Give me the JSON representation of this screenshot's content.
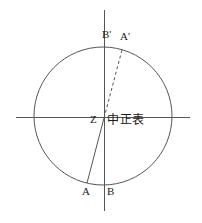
{
  "figure": {
    "type": "geometric-diagram",
    "width": 202,
    "height": 223,
    "background_color": "#ffffff",
    "stroke_color": "#555555",
    "text_color": "#1a1a1a",
    "circle": {
      "center_x": 103,
      "center_y": 116,
      "radius": 69
    },
    "axes": {
      "horizontal": {
        "x1": 16,
        "y1": 117,
        "x2": 190,
        "y2": 117
      },
      "vertical": {
        "x1": 104,
        "y1": 10,
        "x2": 104,
        "y2": 211
      }
    },
    "lines": [
      {
        "name": "gnomon-shadow-solid",
        "style": "solid",
        "x1": 104,
        "y1": 118,
        "x2": 87,
        "y2": 183
      },
      {
        "name": "gnomon-ray-dashed",
        "style": "dashed",
        "x1": 104,
        "y1": 118,
        "x2": 122,
        "y2": 50
      }
    ],
    "labels": {
      "b_prime": "B'",
      "a_prime": "A'",
      "center": "Z",
      "instrument_name": "中正表",
      "a": "A",
      "b": "B"
    }
  }
}
